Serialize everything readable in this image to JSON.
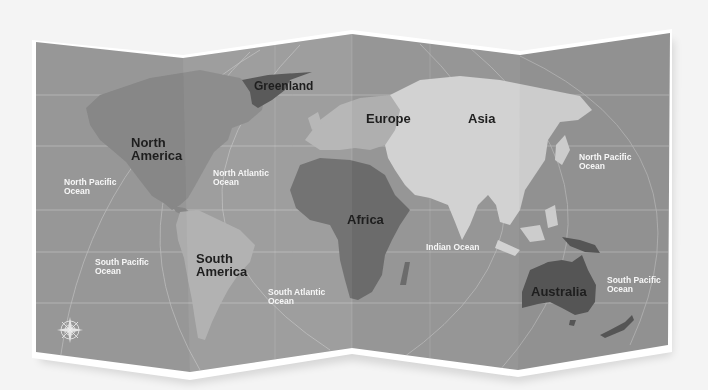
{
  "map": {
    "title": "World Map",
    "style": "folded paper, grayscale",
    "colors": {
      "page_bg": "#f4f4f4",
      "paper_edge": "#ffffff",
      "ocean": "#9b9b9b",
      "north_america": "#8a8a8a",
      "greenland": "#555555",
      "europe": "#b5b5b5",
      "asia": "#d9d9d9",
      "africa": "#6f6f6f",
      "south_america": "#b0b0b0",
      "australia": "#5b5b5b",
      "graticule": "#c8c8c8",
      "continent_label": "#1e1e1e",
      "ocean_label": "#f6f6f6"
    },
    "continents": [
      {
        "id": "greenland",
        "label": "Greenland"
      },
      {
        "id": "north-america",
        "label": "North\nAmerica"
      },
      {
        "id": "europe",
        "label": "Europe"
      },
      {
        "id": "asia",
        "label": "Asia"
      },
      {
        "id": "africa",
        "label": "Africa"
      },
      {
        "id": "south-america",
        "label": "South\nAmerica"
      },
      {
        "id": "australia",
        "label": "Australia"
      }
    ],
    "oceans": [
      {
        "id": "north-pacific-west",
        "label": "North Pacific\nOcean"
      },
      {
        "id": "north-atlantic",
        "label": "North Atlantic\nOcean"
      },
      {
        "id": "north-pacific-east",
        "label": "North Pacific\nOcean"
      },
      {
        "id": "south-pacific-west",
        "label": "South Pacific\nOcean"
      },
      {
        "id": "south-atlantic",
        "label": "South Atlantic\nOcean"
      },
      {
        "id": "indian",
        "label": "Indian Ocean"
      },
      {
        "id": "south-pacific-east",
        "label": "South Pacific\nOcean"
      }
    ],
    "compass": {
      "icon": "compass-rose-icon",
      "directions": [
        "N",
        "E",
        "S",
        "W"
      ]
    }
  }
}
